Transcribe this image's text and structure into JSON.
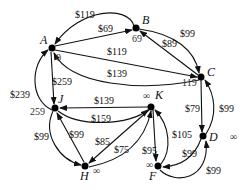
{
  "diagram": {
    "type": "weighted-directed-graph",
    "nodes": [
      {
        "id": "A",
        "label": "A",
        "dist": "0"
      },
      {
        "id": "B",
        "label": "B",
        "dist": "69"
      },
      {
        "id": "C",
        "label": "C",
        "dist": "119"
      },
      {
        "id": "D",
        "label": "D",
        "dist": "∞"
      },
      {
        "id": "J",
        "label": "J",
        "dist": "259"
      },
      {
        "id": "K",
        "label": "K",
        "dist": "∞"
      },
      {
        "id": "H",
        "label": "H",
        "dist": "∞"
      },
      {
        "id": "F",
        "label": "F",
        "dist": "∞"
      }
    ],
    "edges": [
      {
        "from": "B",
        "to": "A",
        "weight": "$119"
      },
      {
        "from": "A",
        "to": "B",
        "weight": "$69"
      },
      {
        "from": "A",
        "to": "C",
        "weight": "$119"
      },
      {
        "from": "C",
        "to": "A",
        "weight": "$139"
      },
      {
        "from": "B",
        "to": "C",
        "weight": "$99"
      },
      {
        "from": "C",
        "to": "B",
        "weight": "$89"
      },
      {
        "from": "A",
        "to": "J",
        "weight": "$259"
      },
      {
        "from": "J",
        "to": "A",
        "weight": "$239"
      },
      {
        "from": "K",
        "to": "J",
        "weight": "$139"
      },
      {
        "from": "J",
        "to": "K",
        "weight": "$159"
      },
      {
        "from": "J",
        "to": "H",
        "weight": "$99"
      },
      {
        "from": "H",
        "to": "J",
        "weight": "$99"
      },
      {
        "from": "K",
        "to": "H",
        "weight": "$85"
      },
      {
        "from": "H",
        "to": "K",
        "weight": "$75"
      },
      {
        "from": "K",
        "to": "F",
        "weight": "$95"
      },
      {
        "from": "F",
        "to": "K",
        "weight": "$105"
      },
      {
        "from": "C",
        "to": "D",
        "weight": "$79"
      },
      {
        "from": "D",
        "to": "C",
        "weight": "$99"
      },
      {
        "from": "D",
        "to": "F",
        "weight": "$99"
      },
      {
        "from": "F",
        "to": "D",
        "weight": "$99"
      }
    ]
  }
}
